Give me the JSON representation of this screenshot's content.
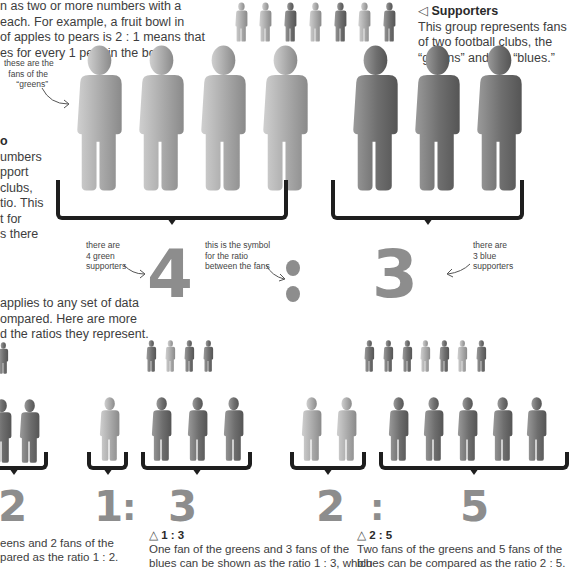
{
  "intro": {
    "lines": [
      "n as two or more numbers with a",
      "each. For example, a fruit bowl in",
      "of apples to pears is 2 : 1 means that",
      "es for every 1 pear in the bowl."
    ]
  },
  "side_box": {
    "title_fragment": "o",
    "lines": [
      "umbers",
      "pport",
      "clubs,",
      "tio. This",
      "t for",
      "s there"
    ]
  },
  "supporters": {
    "icon": "triangle-left-icon",
    "title": "Supporters",
    "lines": [
      "This group represents fans",
      "of two football clubs, the",
      "“greens” and the “blues.”"
    ]
  },
  "annotations": {
    "greens_fans": [
      "these are the",
      "fans of the",
      "“greens”"
    ],
    "green_count": [
      "there are",
      "4 green",
      "supporters"
    ],
    "ratio_symbol": [
      "this is the symbol",
      "for the ratio",
      "between the fans"
    ],
    "blue_count": [
      "there are",
      "3 blue",
      "supporters"
    ]
  },
  "main_ratio": {
    "left": "4",
    "sep": ":",
    "right": "3"
  },
  "colors": {
    "green_fan": "#a9a9a9",
    "blue_fan": "#6e6e6e",
    "bracket": "#1e1e1e",
    "numeral": "#8d8d8d"
  },
  "mid_text": {
    "lines": [
      "applies to any set of data",
      "ompared. Here are more",
      "d the ratios they represent."
    ]
  },
  "examples": [
    {
      "numerals": {
        "left": "",
        "right": "2"
      },
      "caption_title": "",
      "caption_lines": [
        "eens and 2 fans of the",
        "pared as the ratio 1 : 2."
      ]
    },
    {
      "numerals": {
        "left": "1",
        "sep": ":",
        "right": "3"
      },
      "caption_icon": "triangle-up-icon",
      "caption_title": "1 : 3",
      "caption_lines": [
        "One fan of the greens and 3 fans of the",
        "blues can be shown as the ratio 1 : 3, which"
      ]
    },
    {
      "numerals": {
        "left": "2",
        "sep": ":",
        "right": "5"
      },
      "caption_icon": "triangle-up-icon",
      "caption_title": "2 : 5",
      "caption_lines": [
        "Two fans of the greens and 5 fans of the",
        "blues can be compared as the ratio 2 : 5."
      ]
    }
  ]
}
